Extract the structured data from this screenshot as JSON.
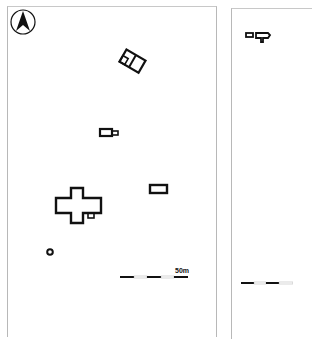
{
  "figure": {
    "left_panel": {
      "north_arrow": {
        "letter": "N"
      },
      "scale_bar": {
        "label": "50m",
        "segments": 5
      },
      "features": [
        {
          "name": "rotated-two-room-building"
        },
        {
          "name": "small-building-with-annex"
        },
        {
          "name": "cross-shaped-building"
        },
        {
          "name": "rectangular-building"
        },
        {
          "name": "circular-feature"
        }
      ]
    },
    "right_panel": {
      "features": [
        {
          "name": "small-paired-building"
        }
      ],
      "scale_bar": {
        "segments": 4
      }
    }
  }
}
